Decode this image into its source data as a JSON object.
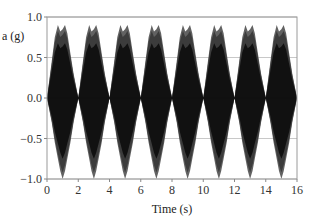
{
  "chart_data": {
    "type": "area",
    "title": "",
    "xlabel": "Time (s)",
    "ylabel": "a (g)",
    "xlim": [
      0,
      16
    ],
    "ylim": [
      -1.0,
      1.0
    ],
    "xticks": [
      0,
      2,
      4,
      6,
      8,
      10,
      12,
      14,
      16
    ],
    "xtick_labels": [
      "0",
      "2",
      "4",
      "6",
      "8",
      "10",
      "12",
      "14",
      "16"
    ],
    "yticks": [
      1.0,
      0.5,
      0.0,
      -0.5,
      -1.0
    ],
    "ytick_labels": [
      "1.0",
      "0.5",
      "0.0",
      "−1.0",
      "−0.5"
    ],
    "grid": "horizontal",
    "legend": null,
    "series": [
      {
        "name": "envelope_upper",
        "x": [
          0,
          0.3,
          0.5,
          0.7,
          0.85,
          1.0,
          1.15,
          1.3,
          1.5,
          1.7,
          2.0
        ],
        "values": [
          0.0,
          0.45,
          0.75,
          0.9,
          0.82,
          0.85,
          0.9,
          0.8,
          0.55,
          0.3,
          0.0
        ]
      },
      {
        "name": "envelope_lower",
        "x": [
          0,
          0.3,
          0.5,
          0.7,
          0.85,
          1.0,
          1.15,
          1.3,
          1.5,
          1.7,
          2.0
        ],
        "values": [
          0.0,
          -0.3,
          -0.55,
          -0.75,
          -0.9,
          -1.0,
          -0.9,
          -0.75,
          -0.55,
          -0.3,
          0.0
        ]
      }
    ],
    "period_s": 2,
    "lobe_centers": [
      1,
      3,
      5,
      7,
      9,
      11,
      13,
      15
    ],
    "colors": {
      "fill_dark": "#111111",
      "fill_mid": "#3a3a3a",
      "fill_light": "#5a5a5a",
      "grid": "#c8c8c8",
      "axis": "#888888"
    }
  }
}
